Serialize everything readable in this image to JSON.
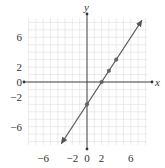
{
  "chart_data": {
    "type": "line",
    "title": "",
    "xlabel": "x",
    "ylabel": "y",
    "xlim": [
      -8,
      8
    ],
    "ylim": [
      -8.5,
      8.5
    ],
    "grid": true,
    "x_ticks": [
      "-6",
      "-2",
      "0",
      "2",
      "6"
    ],
    "y_ticks": [
      "6",
      "2",
      "0",
      "-2",
      "-6"
    ],
    "equation": "y = 1.5x - 3",
    "series": [
      {
        "name": "line",
        "points": [
          {
            "x": 0,
            "y": -3
          },
          {
            "x": 2,
            "y": 0
          },
          {
            "x": 3,
            "y": 1.5
          },
          {
            "x": 4,
            "y": 3
          }
        ],
        "line_extent": [
          {
            "x": -3.5,
            "y": -8.25
          },
          {
            "x": 7.5,
            "y": 8.25
          }
        ],
        "arrows": true
      }
    ],
    "colors": {
      "line": "#555555",
      "grid": "#dddddd",
      "axis": "#333333"
    }
  }
}
